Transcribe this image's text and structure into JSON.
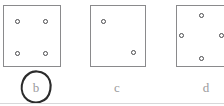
{
  "figure": {
    "canvas": {
      "width": 224,
      "height": 106
    },
    "colors": {
      "background": "#ffffff",
      "panel_border": "#8a8a8c",
      "dot_stroke": "#4a4a4d",
      "dot_fill": "#ffffff",
      "label_text": "#9a9a9c",
      "ink_annotation": "#2b2b2b",
      "bottom_rule": "#d8d8da"
    },
    "panels": [
      {
        "id": "panel-b",
        "label": "b",
        "label_circled": true,
        "box": {
          "x": 3,
          "y": 5,
          "width": 58,
          "height": 62
        },
        "dot_count": 4,
        "arrangement": "square-corners",
        "dots": [
          {
            "x": 17,
            "y": 21
          },
          {
            "x": 45,
            "y": 21
          },
          {
            "x": 17,
            "y": 53
          },
          {
            "x": 45,
            "y": 53
          }
        ]
      },
      {
        "id": "panel-c",
        "label": "c",
        "label_circled": false,
        "box": {
          "x": 90,
          "y": 5,
          "width": 56,
          "height": 62
        },
        "dot_count": 2,
        "arrangement": "diagonal",
        "dots": [
          {
            "x": 103,
            "y": 21
          },
          {
            "x": 133,
            "y": 52
          }
        ]
      },
      {
        "id": "panel-d",
        "label": "d",
        "label_circled": false,
        "box": {
          "x": 176,
          "y": 5,
          "width": 56,
          "height": 62
        },
        "clipped_at_right_edge": true,
        "dot_count": 4,
        "arrangement": "diamond",
        "dots": [
          {
            "x": 201,
            "y": 15
          },
          {
            "x": 181,
            "y": 35
          },
          {
            "x": 221,
            "y": 35
          },
          {
            "x": 201,
            "y": 58
          }
        ]
      }
    ],
    "labels": [
      {
        "text": "b",
        "x": 36,
        "y": 87
      },
      {
        "text": "c",
        "x": 117,
        "y": 87
      },
      {
        "text": "d",
        "x": 206,
        "y": 87
      }
    ],
    "annotation": {
      "type": "hand-drawn-circle",
      "target_label": "b",
      "center_x": 36,
      "center_y": 87,
      "radius_x": 12,
      "radius_y": 15
    }
  }
}
